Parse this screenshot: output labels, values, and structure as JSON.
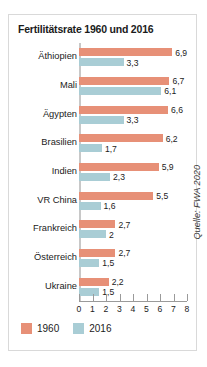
{
  "chart_data": {
    "type": "bar",
    "orientation": "horizontal",
    "title": "Fertilitätsrate 1960 und 2016",
    "xlabel": "",
    "ylabel": "",
    "xlim": [
      0,
      8
    ],
    "xticks": [
      "0",
      "1",
      "2",
      "3",
      "4",
      "5",
      "6",
      "7",
      "8"
    ],
    "grid": false,
    "legend_position": "bottom-left",
    "categories": [
      "Äthiopien",
      "Mali",
      "Ägypten",
      "Brasilien",
      "Indien",
      "VR China",
      "Frankreich",
      "Österreich",
      "Ukraine"
    ],
    "series": [
      {
        "name": "1960",
        "color": "#e79077",
        "values": [
          6.9,
          6.7,
          6.6,
          6.2,
          5.9,
          5.5,
          2.7,
          2.7,
          2.2
        ],
        "labels": [
          "6,9",
          "6,7",
          "6,6",
          "6,2",
          "5,9",
          "5,5",
          "2,7",
          "2,7",
          "2,2"
        ]
      },
      {
        "name": "2016",
        "color": "#a9cdd5",
        "values": [
          3.3,
          6.1,
          3.3,
          1.7,
          2.3,
          1.6,
          2.0,
          1.5,
          1.5
        ],
        "labels": [
          "3,3",
          "6,1",
          "3,3",
          "1,7",
          "2,3",
          "1,6",
          "2",
          "1,5",
          "1,5"
        ]
      }
    ],
    "source": "Quelle: FWA 2020"
  },
  "legend": {
    "items": [
      {
        "label": "1960"
      },
      {
        "label": "2016"
      }
    ]
  }
}
